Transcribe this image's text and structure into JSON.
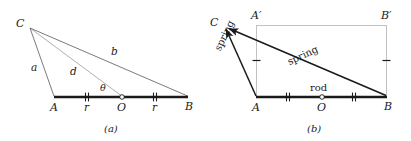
{
  "figure": {
    "panels": [
      {
        "id": "a",
        "caption": "(a)",
        "points": [
          {
            "name": "C",
            "label": "C",
            "x": 28,
            "y": 26
          },
          {
            "name": "A",
            "label": "A",
            "x": 54,
            "y": 97
          },
          {
            "name": "O",
            "label": "O",
            "x": 122,
            "y": 97
          },
          {
            "name": "B",
            "label": "B",
            "x": 188,
            "y": 97
          }
        ],
        "segment_labels": [
          {
            "name": "a",
            "label": "a"
          },
          {
            "name": "d",
            "label": "d"
          },
          {
            "name": "b",
            "label": "b"
          },
          {
            "name": "r-left",
            "label": "r"
          },
          {
            "name": "r-right",
            "label": "r"
          },
          {
            "name": "theta",
            "label": "θ"
          }
        ]
      },
      {
        "id": "b",
        "caption": "(b)",
        "points": [
          {
            "name": "C",
            "label": "C",
            "x": 222,
            "y": 25
          },
          {
            "name": "A-prime",
            "label": "A′",
            "x": 256,
            "y": 25
          },
          {
            "name": "B-prime",
            "label": "B′",
            "x": 387,
            "y": 25
          },
          {
            "name": "A",
            "label": "A",
            "x": 256,
            "y": 97
          },
          {
            "name": "O",
            "label": "O",
            "x": 322,
            "y": 97
          },
          {
            "name": "B",
            "label": "B",
            "x": 387,
            "y": 97
          }
        ],
        "member_labels": [
          {
            "name": "spring-left",
            "label": "spring"
          },
          {
            "name": "spring-diagonal",
            "label": "spring"
          },
          {
            "name": "rod",
            "label": "rod"
          }
        ]
      }
    ],
    "colors": {
      "ink": "#1a1a1a",
      "thin_line": "#6b6b6b",
      "guide_line": "#9a9a9a",
      "background": "#ffffff"
    }
  }
}
